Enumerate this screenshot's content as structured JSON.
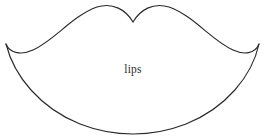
{
  "figure": {
    "label": "lips",
    "shape_name": "lips-outline",
    "background_color": "#ffffff",
    "stroke_color": "#2a2a2a",
    "label_color": "#2c2c2c",
    "canvas": {
      "width": 266,
      "height": 140
    },
    "geometry": {
      "left_corner": [
        6,
        44
      ],
      "right_corner": [
        259,
        44
      ],
      "cupid_bow_notch": [
        133,
        22
      ],
      "upper_left_peak": [
        97,
        6
      ],
      "upper_right_peak": [
        168,
        6
      ],
      "lower_lip_bottom": [
        133,
        134
      ],
      "upper_path": "M 6 44 C 10 54 22 55 33 50 C 55 40 72 16 97 7 C 113 2 126 10 133 22 C 140 10 153 2 169 7 C 194 16 211 40 233 50 C 244 55 255 54 259 44",
      "lower_path": "M 6 44 C 14 76 40 108 80 124 C 98 131 116 134 133 134 C 150 134 168 131 186 124 C 226 108 252 76 259 44"
    }
  }
}
